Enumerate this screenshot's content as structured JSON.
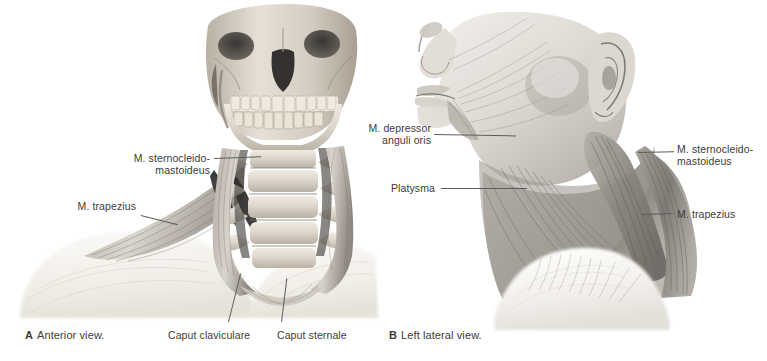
{
  "plate": {
    "background": "#ffffff",
    "ink": "#3b3b3b",
    "leader_color": "#5d5d5d",
    "width": 767,
    "height": 361
  },
  "panels": [
    {
      "id": "A",
      "letter": "A",
      "caption": "Anterior view.",
      "subject": "skull-cervical-spine-anterior-dissection",
      "labels": [
        {
          "name": "m-sternocleidomastoideus",
          "text": "M. sternocleido-\nmastoideus",
          "align": "right"
        },
        {
          "name": "m-trapezius",
          "text": "M. trapezius",
          "align": "right"
        },
        {
          "name": "caput-claviculare",
          "text": "Caput claviculare",
          "align": "left"
        },
        {
          "name": "caput-sternale",
          "text": "Caput sternale",
          "align": "left"
        }
      ]
    },
    {
      "id": "B",
      "letter": "B",
      "caption": "Left lateral view.",
      "subject": "head-neck-left-lateral-superficial-dissection",
      "labels": [
        {
          "name": "m-depressor-anguli-oris",
          "text": "M. depressor\nanguli oris",
          "align": "right"
        },
        {
          "name": "platysma",
          "text": "Platysma",
          "align": "right"
        },
        {
          "name": "m-sternocleidomastoideus",
          "text": "M. sternocleido-\nmastoideus",
          "align": "left"
        },
        {
          "name": "m-trapezius",
          "text": "M. trapezius",
          "align": "left"
        }
      ]
    }
  ]
}
